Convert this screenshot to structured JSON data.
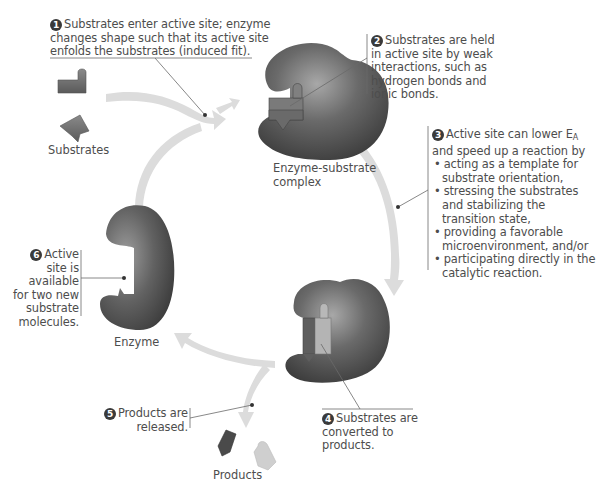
{
  "diagram": {
    "steps": [
      {
        "number": "1",
        "text": "Substrates enter active site; enzyme changes shape such that its active site enfolds the substrates (induced fit).",
        "lines": [
          "Substrates enter active site; enzyme",
          "changes shape such that its active site",
          "enfolds the substrates (induced fit)."
        ]
      },
      {
        "number": "2",
        "text": "Substrates are held in active site by weak interactions, such as hydrogen bonds and ionic bonds.",
        "lines": [
          "Substrates are held",
          "in active site by weak",
          "interactions, such as",
          "hydrogen bonds and",
          "ionic bonds."
        ]
      },
      {
        "number": "3",
        "intro_lines": [
          "Active site can lower E",
          "and speed up a reaction by"
        ],
        "intro_subscript": "A",
        "bullets": [
          {
            "lines": [
              "acting as a template for",
              "substrate orientation,"
            ]
          },
          {
            "lines": [
              "stressing the substrates",
              "and stabilizing the",
              "transition state,"
            ]
          },
          {
            "lines": [
              "providing a favorable",
              "microenvironment, and/or"
            ]
          },
          {
            "lines": [
              "participating directly in the",
              "catalytic reaction."
            ]
          }
        ]
      },
      {
        "number": "4",
        "text": "Substrates are converted to products.",
        "lines": [
          "Substrates are",
          "converted to",
          "products."
        ]
      },
      {
        "number": "5",
        "text": "Products are released.",
        "lines": [
          "Products are",
          "released."
        ]
      },
      {
        "number": "6",
        "text": "Active site is available for two new substrate molecules.",
        "lines": [
          "Active",
          "site is",
          "available",
          "for two new",
          "substrate",
          "molecules."
        ]
      }
    ],
    "captions": {
      "substrates": "Substrates",
      "enzyme_substrate_complex_line1": "Enzyme-substrate",
      "enzyme_substrate_complex_line2": "complex",
      "enzyme": "Enzyme",
      "products": "Products"
    },
    "colors": {
      "enzyme": "#5f5f5f",
      "enzyme_highlight": "#9a9a9a",
      "arrow": "#d9d9d9",
      "substrate": "#6e6e6e",
      "leader_line": "#6a6a6a",
      "number_badge": "#3a3a3a",
      "text": "#4d4d4d"
    }
  }
}
